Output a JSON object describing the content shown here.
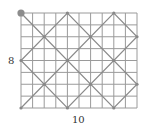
{
  "diagram": {
    "cols": 10,
    "rows": 8,
    "labels": {
      "width": "10",
      "height": "8"
    },
    "start_point": [
      0,
      8
    ],
    "path": [
      [
        0,
        8
      ],
      [
        8,
        0
      ],
      [
        10,
        2
      ],
      [
        4,
        8
      ],
      [
        0,
        4
      ],
      [
        4,
        0
      ],
      [
        10,
        6
      ],
      [
        8,
        8
      ],
      [
        0,
        0
      ]
    ],
    "crossing_points": [
      [
        2,
        6
      ],
      [
        6,
        6
      ],
      [
        0,
        4
      ],
      [
        4,
        4
      ],
      [
        8,
        4
      ],
      [
        2,
        2
      ],
      [
        6,
        2
      ],
      [
        10,
        2
      ],
      [
        10,
        6
      ],
      [
        4,
        8
      ],
      [
        8,
        8
      ],
      [
        4,
        0
      ],
      [
        8,
        0
      ],
      [
        0,
        0
      ]
    ],
    "colors": {
      "grid": "#9a9a9a",
      "path": "#8a8a8a",
      "dot": "#888888",
      "start_dot": "#8c8c8c",
      "label": "#333333"
    }
  }
}
